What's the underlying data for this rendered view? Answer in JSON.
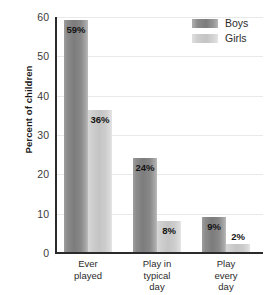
{
  "chart_data": {
    "type": "bar",
    "title": "",
    "xlabel": "",
    "ylabel": "Percent of children",
    "ylim": [
      0,
      60
    ],
    "yticks": [
      0,
      10,
      20,
      30,
      40,
      50,
      60
    ],
    "ytick_labels": [
      "0",
      "10",
      "20",
      "30",
      "40",
      "50",
      "60"
    ],
    "grid": true,
    "legend_position": "top-right",
    "categories": [
      "Ever played",
      "Play in typical day",
      "Play every day"
    ],
    "category_lines": [
      [
        "Ever",
        "played"
      ],
      [
        "Play in",
        "typical",
        "day"
      ],
      [
        "Play",
        "every",
        "day"
      ]
    ],
    "series": [
      {
        "name": "Boys",
        "color": "#7c7c7c",
        "values": [
          59,
          24,
          9
        ],
        "value_labels": [
          "59%",
          "24%",
          "9%"
        ],
        "label_placement": [
          "inside",
          "inside",
          "inside"
        ]
      },
      {
        "name": "Girls",
        "color": "#c4c4c4",
        "values": [
          36,
          8,
          2
        ],
        "value_labels": [
          "36%",
          "8%",
          "2%"
        ],
        "label_placement": [
          "inside",
          "inside",
          "above"
        ]
      }
    ]
  },
  "legend": {
    "items": [
      {
        "label": "Boys",
        "swatch": "boys"
      },
      {
        "label": "Girls",
        "swatch": "girls"
      }
    ]
  },
  "colors": {
    "axis": "#2b2b2b",
    "gridline": "#e9e9e9",
    "text": "#2b2b2b",
    "background": "#ffffff"
  }
}
